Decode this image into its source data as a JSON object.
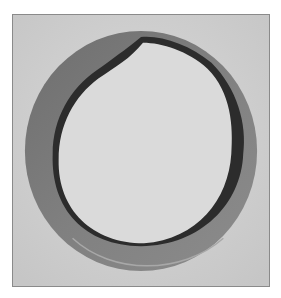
{
  "image": {
    "subject": "metal ring / washer photograph",
    "style": "grayscale halftone photo with thin border",
    "colors": {
      "background": "#d4d4d4",
      "ring": "#7a7a7a",
      "ring_shadow": "#2a2a2a",
      "inner": "#d8d8d8",
      "border": "#8a8a8a"
    }
  }
}
